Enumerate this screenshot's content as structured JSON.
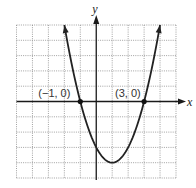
{
  "chart_data": {
    "type": "line",
    "title": "",
    "xlabel": "x",
    "ylabel": "y",
    "xlim": [
      -5,
      5
    ],
    "ylim": [
      -5,
      5
    ],
    "grid": true,
    "grid_step": 1,
    "series": [
      {
        "name": "parabola",
        "equation": "y = x^2 - 2x - 3",
        "coefficients": {
          "a": 1,
          "b": -2,
          "c": -3
        },
        "domain": [
          -2,
          4
        ],
        "arrows_at_ends": true
      }
    ],
    "points": [
      {
        "x": -1,
        "y": 0,
        "label": "(−1, 0)"
      },
      {
        "x": 3,
        "y": 0,
        "label": "(3, 0)"
      }
    ]
  }
}
